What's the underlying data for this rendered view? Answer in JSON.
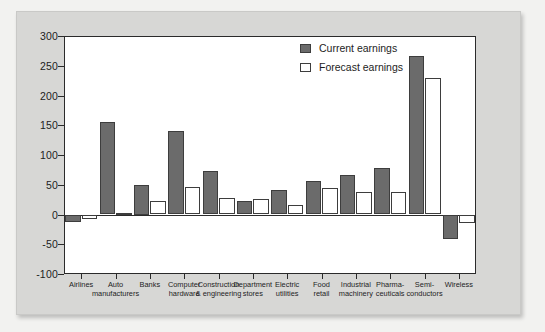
{
  "chart_data": {
    "type": "bar",
    "title": "",
    "subtitle": "",
    "xlabel": "",
    "ylabel": "",
    "ylim": [
      -100,
      300
    ],
    "yticks": [
      300,
      250,
      200,
      150,
      100,
      50,
      0,
      -50,
      -100
    ],
    "ytick_labels": [
      "300",
      "250",
      "200",
      "150",
      "100",
      "50",
      "0",
      "-50",
      "-100"
    ],
    "grid": false,
    "legend_position": "top-right",
    "categories": [
      "Airlines",
      "Auto\nmanufacturers",
      "Banks",
      "Computer\nhardware",
      "Construction\n& engineering",
      "Department\nstores",
      "Electric\nutilities",
      "Food\nretail",
      "Industrial\nmachinery",
      "Pharma-\nceuticals",
      "Semi-\nconductors",
      "Wireless"
    ],
    "series": [
      {
        "name": "Current earnings",
        "color": "#6b6b6b",
        "values": [
          -12,
          156,
          50,
          140,
          73,
          23,
          41,
          57,
          66,
          78,
          267,
          -42
        ]
      },
      {
        "name": "Forecast earnings",
        "color": "#ffffff",
        "values": [
          -7,
          3,
          22,
          46,
          28,
          26,
          16,
          44,
          37,
          37,
          229,
          -14
        ]
      }
    ]
  },
  "colors": {
    "page_background": "#f2f2f0",
    "panel_background": "#d7d7d5",
    "plot_background": "#ffffff",
    "axis": "#2b2b2b",
    "current_fill": "#6b6b6b",
    "forecast_fill": "#ffffff",
    "bar_outline": "#3d3d3d",
    "text": "#1d1d1d"
  }
}
